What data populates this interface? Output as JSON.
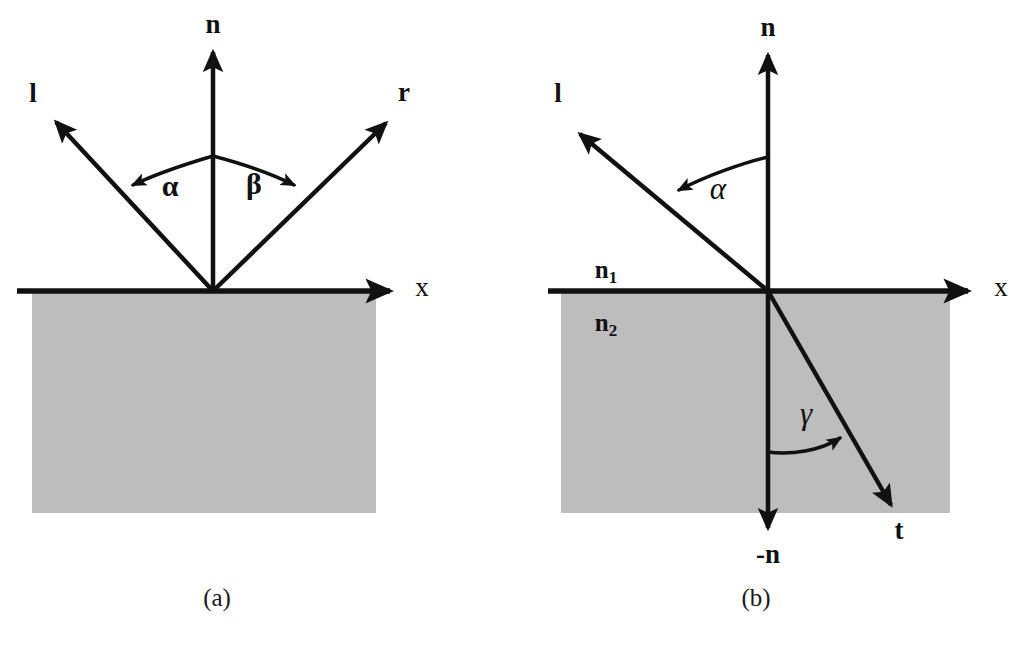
{
  "figure": {
    "background_color": "#ffffff",
    "ink_color": "#111111",
    "medium_fill_color": "#bdbdbd"
  },
  "panel_a": {
    "caption": "(a)",
    "vectors": {
      "normal": "n",
      "incident": "l",
      "reflected": "r"
    },
    "axis": {
      "x": "x"
    },
    "angles": {
      "incidence": "α",
      "reflection": "β"
    }
  },
  "panel_b": {
    "caption": "(b)",
    "vectors": {
      "normal": "n",
      "negative_normal": "-n",
      "incident": "l",
      "transmitted": "t"
    },
    "axis": {
      "x": "x"
    },
    "angles": {
      "incidence": "α",
      "refraction": "γ"
    },
    "media": {
      "upper_symbol": "n",
      "upper_subscript": "1",
      "lower_symbol": "n",
      "lower_subscript": "2"
    }
  }
}
